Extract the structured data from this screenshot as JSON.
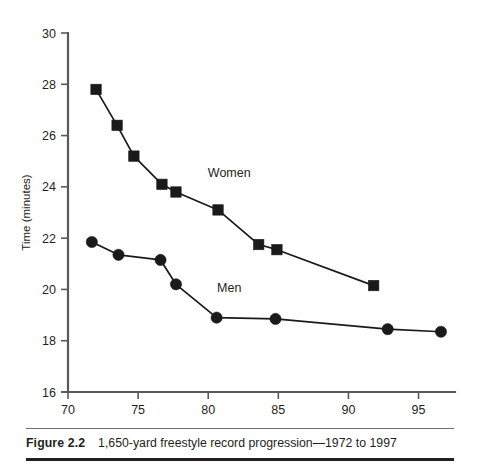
{
  "figure": {
    "caption_label": "Figure 2.2",
    "caption_body": "1,650-yard freestyle record progression—1972 to 1997"
  },
  "chart_data": {
    "type": "line",
    "title": "",
    "xlabel": "Year",
    "ylabel": "Time (minutes)",
    "xlim": [
      70,
      97.6
    ],
    "ylim": [
      16,
      30
    ],
    "xticks": [
      70,
      75,
      80,
      85,
      90,
      95
    ],
    "yticks": [
      16,
      18,
      20,
      22,
      24,
      26,
      28,
      30
    ],
    "xtick_labels": [
      "70",
      "75",
      "80",
      "85",
      "90",
      "95"
    ],
    "ytick_labels": [
      "16",
      "18",
      "20",
      "22",
      "24",
      "26",
      "28",
      "30"
    ],
    "grid": false,
    "legend_position": "inline-annotations",
    "series": [
      {
        "name": "Women",
        "marker": "square",
        "label_x": 81.5,
        "label_y": 24.4,
        "x": [
          72.0,
          73.5,
          74.7,
          76.7,
          77.7,
          80.7,
          83.6,
          84.9,
          91.8
        ],
        "y": [
          27.8,
          26.4,
          25.2,
          24.1,
          23.8,
          23.1,
          21.75,
          21.55,
          20.15
        ]
      },
      {
        "name": "Men",
        "marker": "circle",
        "label_x": 81.5,
        "label_y": 19.9,
        "x": [
          71.7,
          73.6,
          76.6,
          77.7,
          80.6,
          84.8,
          92.8,
          96.6
        ],
        "y": [
          21.85,
          21.35,
          21.15,
          20.2,
          18.9,
          18.85,
          18.45,
          18.35
        ]
      }
    ]
  },
  "colors": {
    "ink": "#1a1a1a",
    "axis": "#58595b",
    "text": "#231f20",
    "background": "#ffffff"
  }
}
